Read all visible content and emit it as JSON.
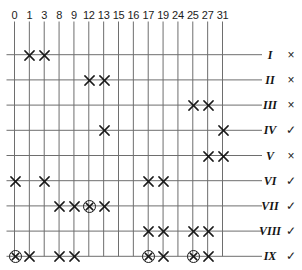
{
  "figure": {
    "columns": [
      "0",
      "1",
      "3",
      "8",
      "9",
      "12",
      "13",
      "15",
      "16",
      "17",
      "19",
      "24",
      "25",
      "27",
      "31"
    ],
    "rows": [
      {
        "label": "I",
        "verdict": "×"
      },
      {
        "label": "II",
        "verdict": "×"
      },
      {
        "label": "III",
        "verdict": "×"
      },
      {
        "label": "IV",
        "verdict": "✓"
      },
      {
        "label": "V",
        "verdict": "×"
      },
      {
        "label": "VI",
        "verdict": "✓"
      },
      {
        "label": "VII",
        "verdict": "✓"
      },
      {
        "label": "VIII",
        "verdict": "✓"
      },
      {
        "label": "IX",
        "verdict": "✓"
      }
    ],
    "marks": [
      {
        "row": 0,
        "col": 1,
        "type": "x"
      },
      {
        "row": 0,
        "col": 2,
        "type": "x"
      },
      {
        "row": 1,
        "col": 5,
        "type": "x"
      },
      {
        "row": 1,
        "col": 6,
        "type": "x"
      },
      {
        "row": 2,
        "col": 12,
        "type": "x"
      },
      {
        "row": 2,
        "col": 13,
        "type": "x"
      },
      {
        "row": 3,
        "col": 6,
        "type": "x"
      },
      {
        "row": 3,
        "col": 14,
        "type": "x"
      },
      {
        "row": 4,
        "col": 13,
        "type": "x"
      },
      {
        "row": 4,
        "col": 14,
        "type": "x"
      },
      {
        "row": 5,
        "col": 0,
        "type": "x"
      },
      {
        "row": 5,
        "col": 2,
        "type": "x"
      },
      {
        "row": 5,
        "col": 9,
        "type": "x"
      },
      {
        "row": 5,
        "col": 10,
        "type": "x"
      },
      {
        "row": 6,
        "col": 3,
        "type": "x"
      },
      {
        "row": 6,
        "col": 4,
        "type": "x"
      },
      {
        "row": 6,
        "col": 5,
        "type": "circled-x"
      },
      {
        "row": 6,
        "col": 6,
        "type": "x"
      },
      {
        "row": 7,
        "col": 9,
        "type": "x"
      },
      {
        "row": 7,
        "col": 10,
        "type": "x"
      },
      {
        "row": 7,
        "col": 12,
        "type": "x"
      },
      {
        "row": 7,
        "col": 13,
        "type": "x"
      },
      {
        "row": 8,
        "col": 0,
        "type": "circled-x"
      },
      {
        "row": 8,
        "col": 1,
        "type": "x"
      },
      {
        "row": 8,
        "col": 3,
        "type": "x"
      },
      {
        "row": 8,
        "col": 4,
        "type": "x"
      },
      {
        "row": 8,
        "col": 9,
        "type": "circled-x"
      },
      {
        "row": 8,
        "col": 10,
        "type": "x"
      },
      {
        "row": 8,
        "col": 12,
        "type": "circled-x"
      },
      {
        "row": 8,
        "col": 13,
        "type": "x"
      }
    ],
    "colors": {
      "grid_line": "#6e6e6e",
      "mark": "#1a1a1a",
      "text": "#1a1a1a"
    }
  }
}
